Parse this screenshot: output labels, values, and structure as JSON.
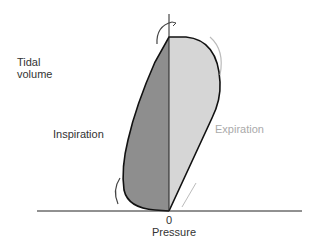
{
  "diagram": {
    "type": "pressure-volume loop",
    "y_axis_label_line1": "Tidal",
    "y_axis_label_line2": "volume",
    "x_axis_label": "Pressure",
    "origin_label": "0",
    "left_region_label": "Inspiration",
    "right_region_label": "Expiration",
    "colors": {
      "inspiration_fill": "#8e8e8e",
      "expiration_fill": "#d6d6d6",
      "outline": "#111111",
      "arrow_light": "#bbbbbb",
      "arrow_dark": "#444444"
    }
  }
}
